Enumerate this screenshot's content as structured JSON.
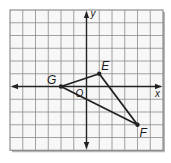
{
  "diagram": {
    "type": "coordinate-plane",
    "grid": {
      "left": 10,
      "top": 10,
      "cols": 12,
      "rows": 11,
      "cell": 12.75,
      "line_color": "#8a8a8a",
      "border_color": "#7a7a7a",
      "shadow_color": "#b5b5b5"
    },
    "axes": {
      "origin_col": 6,
      "origin_row": 6,
      "color": "#222222",
      "x_label": "x",
      "y_label": "y",
      "origin_label": "O"
    },
    "triangle": {
      "color": "#222222",
      "points": [
        {
          "name": "G",
          "x": -2,
          "y": 0,
          "label": "G"
        },
        {
          "name": "E",
          "x": 1,
          "y": 1,
          "label": "E"
        },
        {
          "name": "F",
          "x": 4,
          "y": -3,
          "label": "F"
        }
      ]
    }
  }
}
